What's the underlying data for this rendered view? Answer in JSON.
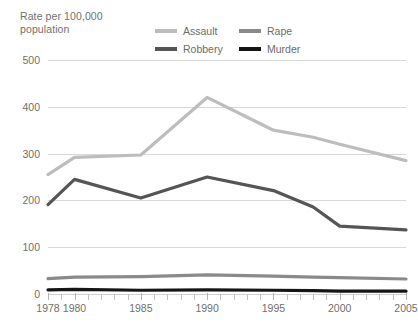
{
  "chart_data": {
    "type": "line",
    "title": "Rate per 100,000\npopulation",
    "xlabel": "",
    "ylabel": "Rate per 100,000 population",
    "ylim": [
      0,
      500
    ],
    "xlim": [
      1978,
      2005
    ],
    "yticks": [
      0,
      100,
      200,
      300,
      400,
      500
    ],
    "xticks": [
      1978,
      1980,
      1985,
      1990,
      1995,
      2000,
      2005
    ],
    "xtick_labels": [
      "1978",
      "1980",
      "1985",
      "1990",
      "1995",
      "2000",
      "2005"
    ],
    "ytick_labels": [
      "0",
      "100",
      "200",
      "300",
      "400",
      "500"
    ],
    "grid": "horizontal",
    "legend_position": "top",
    "x": [
      1978,
      1980,
      1985,
      1990,
      1995,
      1998,
      2000,
      2005
    ],
    "series": [
      {
        "name": "Assault",
        "color": "#bdbdbd",
        "values": [
          255,
          292,
          297,
          420,
          350,
          335,
          320,
          285
        ]
      },
      {
        "name": "Rape",
        "color": "#8a8a8a",
        "values": [
          33,
          36,
          37,
          41,
          38,
          36,
          35,
          32
        ]
      },
      {
        "name": "Robbery",
        "color": "#555555",
        "values": [
          191,
          245,
          205,
          250,
          221,
          186,
          145,
          137
        ]
      },
      {
        "name": "Murder",
        "color": "#151515",
        "values": [
          9,
          10,
          8,
          9,
          8,
          7,
          6,
          6
        ]
      }
    ]
  },
  "legend": {
    "items": [
      {
        "label": "Assault",
        "color": "#bdbdbd"
      },
      {
        "label": "Rape",
        "color": "#8a8a8a"
      },
      {
        "label": "Robbery",
        "color": "#555555"
      },
      {
        "label": "Murder",
        "color": "#151515"
      }
    ]
  },
  "colors": {
    "assault": "#bdbdbd",
    "rape": "#8a8a8a",
    "robbery": "#555555",
    "murder": "#151515",
    "gridline": "#d8d8d8",
    "text": "#6f6f6f",
    "background": "#ffffff"
  }
}
